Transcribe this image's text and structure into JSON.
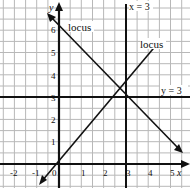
{
  "figure": {
    "header_cutoff_text": "",
    "axes": {
      "x_label": "x",
      "y_label": "y",
      "origin_label": "0",
      "x_ticks": [
        {
          "value": -2,
          "label": "-2"
        },
        {
          "value": -1,
          "label": "-1"
        },
        {
          "value": 1,
          "label": "1"
        },
        {
          "value": 2,
          "label": "2"
        },
        {
          "value": 3,
          "label": "3"
        },
        {
          "value": 4,
          "label": "4"
        },
        {
          "value": 5,
          "label": "5"
        }
      ],
      "y_ticks": [
        {
          "value": 1,
          "label": "1"
        },
        {
          "value": 2,
          "label": "2"
        },
        {
          "value": 3,
          "label": "3"
        },
        {
          "value": 4,
          "label": "4"
        },
        {
          "value": 5,
          "label": "5"
        },
        {
          "value": 6,
          "label": "6"
        }
      ]
    },
    "lines": {
      "vertical_line_label": "x = 3",
      "horizontal_line_label": "y = 3",
      "locus_1_label": "locus",
      "locus_2_label": "locus"
    },
    "colors": {
      "grid": "#b8b8b8",
      "ink": "#111111",
      "background": "#ffffff"
    }
  }
}
